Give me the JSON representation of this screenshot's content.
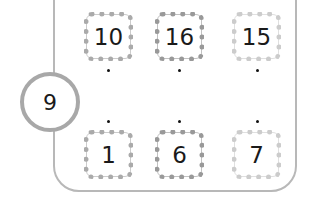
{
  "hub": {
    "value": "9",
    "border_color": "#a8a8a8"
  },
  "frame": {
    "border_color": "#b8b8b8"
  },
  "top_row": [
    {
      "value": "10",
      "border_color": "#aaaaaa"
    },
    {
      "value": "16",
      "border_color": "#999999"
    },
    {
      "value": "15",
      "border_color": "#cccccc"
    }
  ],
  "bottom_row": [
    {
      "value": "1",
      "border_color": "#aaaaaa"
    },
    {
      "value": "6",
      "border_color": "#999999"
    },
    {
      "value": "7",
      "border_color": "#cccccc"
    }
  ],
  "dot_color": "#111111"
}
